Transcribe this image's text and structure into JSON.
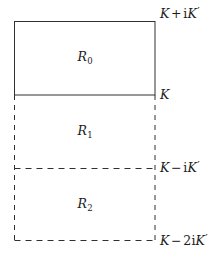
{
  "figure": {
    "width": 224,
    "height": 260,
    "background_color": "#ffffff",
    "stroke_color": "#303030",
    "text_color": "#1c1c1c"
  },
  "geometry": {
    "left_x": 14,
    "right_x": 155,
    "top_y": 21,
    "k_y": 95,
    "mid_y": 168,
    "bottom_y": 240,
    "label_x": 160
  },
  "regions": [
    {
      "id": "R0",
      "name": "region-r0",
      "base": "R",
      "subscript": "0",
      "center_x": 85,
      "center_y": 57,
      "border": "solid"
    },
    {
      "id": "R1",
      "name": "region-r1",
      "base": "R",
      "subscript": "1",
      "center_x": 85,
      "center_y": 131,
      "border": "dashed"
    },
    {
      "id": "R2",
      "name": "region-r2",
      "base": "R",
      "subscript": "2",
      "center_x": 85,
      "center_y": 204,
      "border": "dashed"
    }
  ],
  "corner_labels": [
    {
      "id": "top",
      "name": "corner-label-k-plus-ikprime",
      "text": "K + iK′",
      "parts": {
        "k1": "K",
        "op": "+",
        "i": "i",
        "k2": "K",
        "prime": "′"
      },
      "x": 160,
      "y": 14
    },
    {
      "id": "k",
      "name": "corner-label-k",
      "text": "K",
      "parts": {
        "k1": "K",
        "op": "",
        "i": "",
        "k2": "",
        "prime": ""
      },
      "x": 160,
      "y": 95
    },
    {
      "id": "minus",
      "name": "corner-label-k-minus-ikprime",
      "text": "K − iK′",
      "parts": {
        "k1": "K",
        "op": "−",
        "i": "i",
        "k2": "K",
        "prime": "′"
      },
      "x": 160,
      "y": 168
    },
    {
      "id": "minus2",
      "name": "corner-label-k-minus-2ikprime",
      "text": "K − 2iK′",
      "parts": {
        "k1": "K",
        "op": "−",
        "i": "2i",
        "k2": "K",
        "prime": "′"
      },
      "x": 160,
      "y": 241
    }
  ]
}
